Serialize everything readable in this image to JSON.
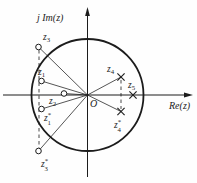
{
  "diagram": {
    "type": "pole-zero-plot",
    "ink_color": "#1c1c1c",
    "background_color": "#fefefe",
    "axes": {
      "horizontal_label": "Re(z)",
      "vertical_label": "j Im(z)",
      "origin_label": "O",
      "h_label_x": 169,
      "h_label_y": 109,
      "v_label_x": 37,
      "v_label_y": 21,
      "o_label_x": 90,
      "o_label_y": 107,
      "axis_x": 87.5,
      "axis_y": 95,
      "h_from": 3,
      "h_tip": 193,
      "v_from": 177,
      "v_tip": 7
    },
    "unit_circle": {
      "cx": 87.5,
      "cy": 95,
      "r": 56
    },
    "origin": {
      "x": 87.5,
      "y": 95
    },
    "markers": [
      {
        "id": "z3",
        "kind": "zero",
        "x": 38.5,
        "y": 47,
        "label": {
          "base": "z",
          "sub": "3",
          "sup": ""
        },
        "lx": 43,
        "ly": 40,
        "radial_line": true
      },
      {
        "id": "z1",
        "kind": "zero",
        "x": 41.5,
        "y": 81,
        "label": {
          "base": "z",
          "sub": "1",
          "sup": ""
        },
        "lx": 38,
        "ly": 75,
        "radial_line": true
      },
      {
        "id": "z2",
        "kind": "zero",
        "x": 64,
        "y": 93.5,
        "label": {
          "base": "z",
          "sub": "2",
          "sup": ""
        },
        "lx": 49,
        "ly": 104,
        "radial_line": true
      },
      {
        "id": "z1c",
        "kind": "zero",
        "x": 41.5,
        "y": 109,
        "label": {
          "base": "z",
          "sub": "1",
          "sup": "*"
        },
        "lx": 44,
        "ly": 121,
        "radial_line": true
      },
      {
        "id": "z3c",
        "kind": "zero",
        "x": 38.5,
        "y": 151,
        "label": {
          "base": "z",
          "sub": "3",
          "sup": "*"
        },
        "lx": 41,
        "ly": 167,
        "radial_line": true
      },
      {
        "id": "z4",
        "kind": "pole",
        "x": 121,
        "y": 77,
        "label": {
          "base": "z",
          "sub": "4",
          "sup": ""
        },
        "lx": 107,
        "ly": 72,
        "radial_line": true
      },
      {
        "id": "z5",
        "kind": "pole",
        "x": 133,
        "y": 95,
        "label": {
          "base": "z",
          "sub": "5",
          "sup": ""
        },
        "lx": 128,
        "ly": 88,
        "radial_line": false
      },
      {
        "id": "z4c",
        "kind": "pole",
        "x": 121,
        "y": 111.5,
        "label": {
          "base": "z",
          "sub": "4",
          "sup": "*"
        },
        "lx": 114,
        "ly": 128,
        "radial_line": true
      }
    ],
    "dashed_lines": [
      {
        "x1": 39,
        "y1": 50,
        "x2": 39,
        "y2": 148
      },
      {
        "x1": 121,
        "y1": 80,
        "x2": 121,
        "y2": 109
      }
    ],
    "style": {
      "circle_stroke_width": 1.8,
      "axis_stroke_width": 1,
      "radial_stroke_width": 0.75,
      "dash_pattern": "3.5 3",
      "zero_radius": 2.8,
      "cross_arm": 3.6,
      "label_font_size": 9.5,
      "script_font_size": 6.8,
      "axis_label_font_size": 10
    }
  }
}
